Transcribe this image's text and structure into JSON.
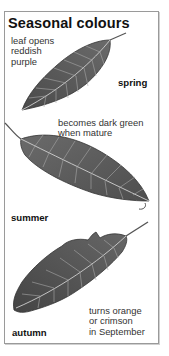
{
  "panel": {
    "title": "Seasonal colours",
    "seasons": [
      {
        "name": "spring",
        "label": "spring",
        "note": "leaf opens\nreddish\npurple"
      },
      {
        "name": "summer",
        "label": "summer",
        "note": "becomes dark green\nwhen mature"
      },
      {
        "name": "autumn",
        "label": "autumn",
        "note": "turns orange\nor crimson\nin September"
      }
    ]
  },
  "colors": {
    "leaf_fill": "#5a5a5a",
    "leaf_dark": "#3a3a3a",
    "vein": "#bdbdbd",
    "border": "#9a9a9a"
  }
}
